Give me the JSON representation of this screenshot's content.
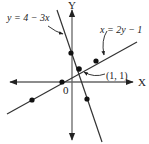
{
  "diagram": {
    "axes": {
      "x_label": "X",
      "y_label": "Y",
      "origin_label": "0"
    },
    "lines": [
      {
        "name": "line-steep",
        "equation": "y = 4 − 3x"
      },
      {
        "name": "line-shallow",
        "equation": "x = 2y − 1"
      }
    ],
    "intersection": {
      "label": "(1, 1)"
    },
    "colors": {
      "axis": "#666666",
      "line": "#333333",
      "point": "#111111",
      "text": "#222222"
    }
  }
}
